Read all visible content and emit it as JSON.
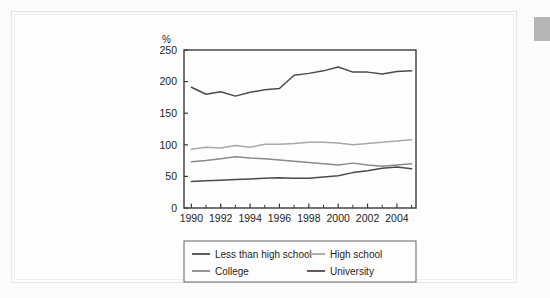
{
  "chart_data": {
    "type": "line",
    "title": "",
    "xlabel": "",
    "ylabel": "%",
    "unit_label": "%",
    "x": [
      1990,
      1991,
      1992,
      1993,
      1994,
      1995,
      1996,
      1997,
      1998,
      1999,
      2000,
      2001,
      2002,
      2003,
      2004,
      2005
    ],
    "xlim": [
      1989.5,
      2005.3
    ],
    "ylim": [
      0,
      250
    ],
    "xticks": [
      1990,
      1992,
      1994,
      1996,
      1998,
      2000,
      2002,
      2004
    ],
    "xticklabels": [
      "1990",
      "1992",
      "1994",
      "1996",
      "1998",
      "2000",
      "2002",
      "2004"
    ],
    "minor_xticks": [
      1991,
      1993,
      1995,
      1997,
      1999,
      2001,
      2003,
      2005
    ],
    "yticks": [
      0,
      50,
      100,
      150,
      200,
      250
    ],
    "yticklabels": [
      "0",
      "50",
      "100",
      "150",
      "200",
      "250"
    ],
    "grid": false,
    "legend_position": "below",
    "series": [
      {
        "name": "Less than high school",
        "color": "#4a4a4a",
        "values": [
          42,
          43,
          44,
          45,
          46,
          47,
          48,
          47,
          47,
          49,
          51,
          56,
          59,
          63,
          65,
          62
        ]
      },
      {
        "name": "High school",
        "color": "#a8a8a8",
        "values": [
          93,
          96,
          95,
          99,
          96,
          101,
          101,
          102,
          104,
          104,
          103,
          100,
          102,
          104,
          106,
          108
        ]
      },
      {
        "name": "College",
        "color": "#8a8a8a",
        "values": [
          73,
          75,
          78,
          81,
          79,
          78,
          76,
          74,
          72,
          70,
          68,
          71,
          68,
          66,
          68,
          70
        ]
      },
      {
        "name": "University",
        "color": "#4a4a4a",
        "values": [
          191,
          180,
          184,
          177,
          183,
          187,
          189,
          210,
          213,
          217,
          223,
          215,
          215,
          212,
          216,
          217
        ]
      }
    ]
  },
  "legend": {
    "entries": [
      {
        "label": "Less than high school",
        "color": "#4a4a4a"
      },
      {
        "label": "High school",
        "color": "#a8a8a8"
      },
      {
        "label": "College",
        "color": "#8a8a8a"
      },
      {
        "label": "University",
        "color": "#4a4a4a"
      }
    ]
  },
  "frame": {
    "border_color": "#3a3a3a",
    "card_background": "#ffffff"
  }
}
